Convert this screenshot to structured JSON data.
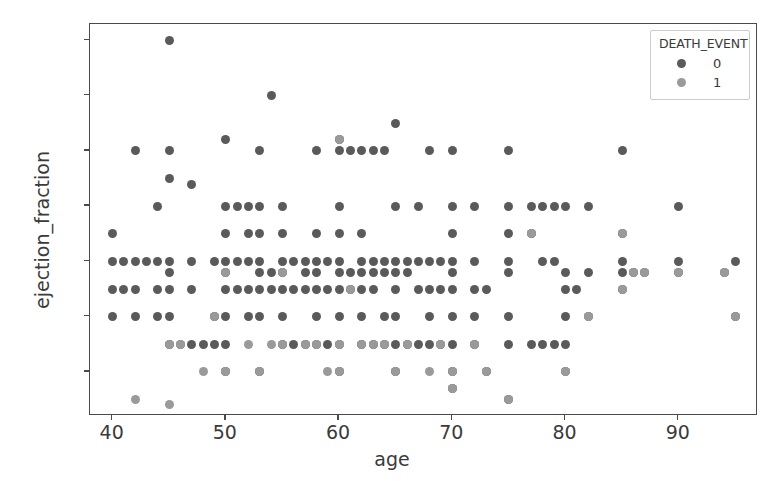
{
  "chart_data": {
    "type": "scatter",
    "title": "",
    "xlabel": "age",
    "ylabel": "ejection_fraction",
    "xlim": [
      38,
      97
    ],
    "ylim": [
      12,
      83
    ],
    "xticks": [
      40,
      50,
      60,
      70,
      80,
      90
    ],
    "yticks": [
      20,
      30,
      40,
      50,
      60,
      70,
      80
    ],
    "grid": false,
    "legend": {
      "title": "DEATH_EVENT",
      "position": "upper right",
      "entries": [
        {
          "label": "0",
          "color": "#5a5a5a"
        },
        {
          "label": "1",
          "color": "#9a9a9a"
        }
      ]
    },
    "series": [
      {
        "name": "0",
        "color": "#5a5a5a",
        "points": [
          [
            40,
            45
          ],
          [
            40,
            40
          ],
          [
            40,
            35
          ],
          [
            40,
            30
          ],
          [
            41,
            40
          ],
          [
            41,
            35
          ],
          [
            42,
            60
          ],
          [
            42,
            40
          ],
          [
            42,
            35
          ],
          [
            42,
            30
          ],
          [
            43,
            40
          ],
          [
            44,
            50
          ],
          [
            44,
            40
          ],
          [
            44,
            35
          ],
          [
            44,
            30
          ],
          [
            45,
            80
          ],
          [
            45,
            60
          ],
          [
            45,
            55
          ],
          [
            45,
            40
          ],
          [
            45,
            38
          ],
          [
            45,
            35
          ],
          [
            45,
            30
          ],
          [
            45,
            25
          ],
          [
            46,
            25
          ],
          [
            47,
            54
          ],
          [
            47,
            40
          ],
          [
            47,
            35
          ],
          [
            47,
            25
          ],
          [
            48,
            25
          ],
          [
            49,
            40
          ],
          [
            49,
            30
          ],
          [
            49,
            25
          ],
          [
            50,
            62
          ],
          [
            50,
            50
          ],
          [
            50,
            45
          ],
          [
            50,
            40
          ],
          [
            50,
            38
          ],
          [
            50,
            35
          ],
          [
            50,
            30
          ],
          [
            50,
            25
          ],
          [
            50,
            20
          ],
          [
            51,
            50
          ],
          [
            51,
            40
          ],
          [
            51,
            35
          ],
          [
            52,
            50
          ],
          [
            52,
            45
          ],
          [
            52,
            40
          ],
          [
            52,
            35
          ],
          [
            52,
            30
          ],
          [
            53,
            60
          ],
          [
            53,
            50
          ],
          [
            53,
            45
          ],
          [
            53,
            40
          ],
          [
            53,
            38
          ],
          [
            53,
            35
          ],
          [
            53,
            30
          ],
          [
            53,
            20
          ],
          [
            54,
            70
          ],
          [
            54,
            38
          ],
          [
            54,
            35
          ],
          [
            55,
            50
          ],
          [
            55,
            45
          ],
          [
            55,
            40
          ],
          [
            55,
            38
          ],
          [
            55,
            35
          ],
          [
            55,
            30
          ],
          [
            55,
            25
          ],
          [
            56,
            40
          ],
          [
            56,
            35
          ],
          [
            56,
            25
          ],
          [
            57,
            40
          ],
          [
            57,
            38
          ],
          [
            57,
            35
          ],
          [
            57,
            25
          ],
          [
            58,
            60
          ],
          [
            58,
            45
          ],
          [
            58,
            40
          ],
          [
            58,
            38
          ],
          [
            58,
            35
          ],
          [
            58,
            30
          ],
          [
            58,
            25
          ],
          [
            59,
            40
          ],
          [
            59,
            35
          ],
          [
            59,
            25
          ],
          [
            60,
            62
          ],
          [
            60,
            60
          ],
          [
            60,
            50
          ],
          [
            60,
            45
          ],
          [
            60,
            40
          ],
          [
            60,
            38
          ],
          [
            60,
            35
          ],
          [
            60,
            30
          ],
          [
            60,
            25
          ],
          [
            60,
            20
          ],
          [
            61,
            60
          ],
          [
            61,
            38
          ],
          [
            61,
            35
          ],
          [
            62,
            60
          ],
          [
            62,
            45
          ],
          [
            62,
            40
          ],
          [
            62,
            38
          ],
          [
            62,
            35
          ],
          [
            62,
            30
          ],
          [
            62,
            25
          ],
          [
            63,
            60
          ],
          [
            63,
            40
          ],
          [
            63,
            38
          ],
          [
            63,
            35
          ],
          [
            63,
            25
          ],
          [
            64,
            60
          ],
          [
            64,
            40
          ],
          [
            64,
            38
          ],
          [
            64,
            30
          ],
          [
            64,
            25
          ],
          [
            65,
            65
          ],
          [
            65,
            50
          ],
          [
            65,
            40
          ],
          [
            65,
            38
          ],
          [
            65,
            35
          ],
          [
            65,
            30
          ],
          [
            65,
            25
          ],
          [
            65,
            20
          ],
          [
            66,
            40
          ],
          [
            66,
            38
          ],
          [
            66,
            25
          ],
          [
            67,
            50
          ],
          [
            67,
            40
          ],
          [
            67,
            35
          ],
          [
            67,
            25
          ],
          [
            68,
            60
          ],
          [
            68,
            40
          ],
          [
            68,
            35
          ],
          [
            68,
            30
          ],
          [
            68,
            25
          ],
          [
            69,
            40
          ],
          [
            69,
            35
          ],
          [
            69,
            25
          ],
          [
            70,
            60
          ],
          [
            70,
            50
          ],
          [
            70,
            45
          ],
          [
            70,
            40
          ],
          [
            70,
            38
          ],
          [
            70,
            35
          ],
          [
            70,
            30
          ],
          [
            70,
            25
          ],
          [
            70,
            20
          ],
          [
            70,
            17
          ],
          [
            72,
            50
          ],
          [
            72,
            40
          ],
          [
            72,
            35
          ],
          [
            72,
            30
          ],
          [
            72,
            25
          ],
          [
            73,
            35
          ],
          [
            73,
            20
          ],
          [
            75,
            60
          ],
          [
            75,
            50
          ],
          [
            75,
            45
          ],
          [
            75,
            40
          ],
          [
            75,
            38
          ],
          [
            75,
            30
          ],
          [
            75,
            25
          ],
          [
            75,
            15
          ],
          [
            77,
            50
          ],
          [
            77,
            45
          ],
          [
            77,
            25
          ],
          [
            78,
            50
          ],
          [
            78,
            40
          ],
          [
            78,
            25
          ],
          [
            79,
            50
          ],
          [
            79,
            40
          ],
          [
            79,
            25
          ],
          [
            80,
            50
          ],
          [
            80,
            38
          ],
          [
            80,
            35
          ],
          [
            80,
            30
          ],
          [
            80,
            25
          ],
          [
            80,
            20
          ],
          [
            81,
            35
          ],
          [
            82,
            50
          ],
          [
            82,
            38
          ],
          [
            82,
            30
          ],
          [
            85,
            60
          ],
          [
            85,
            45
          ],
          [
            85,
            40
          ],
          [
            85,
            38
          ],
          [
            85,
            35
          ],
          [
            86,
            38
          ],
          [
            87,
            38
          ],
          [
            90,
            50
          ],
          [
            90,
            40
          ],
          [
            90,
            38
          ],
          [
            94,
            38
          ],
          [
            95,
            40
          ],
          [
            95,
            30
          ]
        ]
      }
    ],
    "points_class_1": [
      [
        42,
        15
      ],
      [
        45,
        14
      ],
      [
        45,
        25
      ],
      [
        46,
        25
      ],
      [
        48,
        20
      ],
      [
        49,
        30
      ],
      [
        50,
        20
      ],
      [
        52,
        25
      ],
      [
        53,
        20
      ],
      [
        54,
        25
      ],
      [
        55,
        25
      ],
      [
        57,
        25
      ],
      [
        58,
        25
      ],
      [
        59,
        20
      ],
      [
        60,
        25
      ],
      [
        60,
        20
      ],
      [
        61,
        35
      ],
      [
        62,
        25
      ],
      [
        63,
        25
      ],
      [
        64,
        25
      ],
      [
        65,
        20
      ],
      [
        66,
        25
      ],
      [
        68,
        20
      ],
      [
        69,
        25
      ],
      [
        70,
        20
      ],
      [
        70,
        17
      ],
      [
        72,
        25
      ],
      [
        73,
        20
      ],
      [
        75,
        15
      ],
      [
        77,
        45
      ],
      [
        80,
        20
      ],
      [
        82,
        30
      ],
      [
        85,
        45
      ],
      [
        85,
        35
      ],
      [
        86,
        38
      ],
      [
        87,
        38
      ],
      [
        90,
        38
      ],
      [
        94,
        38
      ],
      [
        95,
        30
      ],
      [
        60,
        62
      ],
      [
        50,
        38
      ],
      [
        55,
        38
      ]
    ]
  }
}
